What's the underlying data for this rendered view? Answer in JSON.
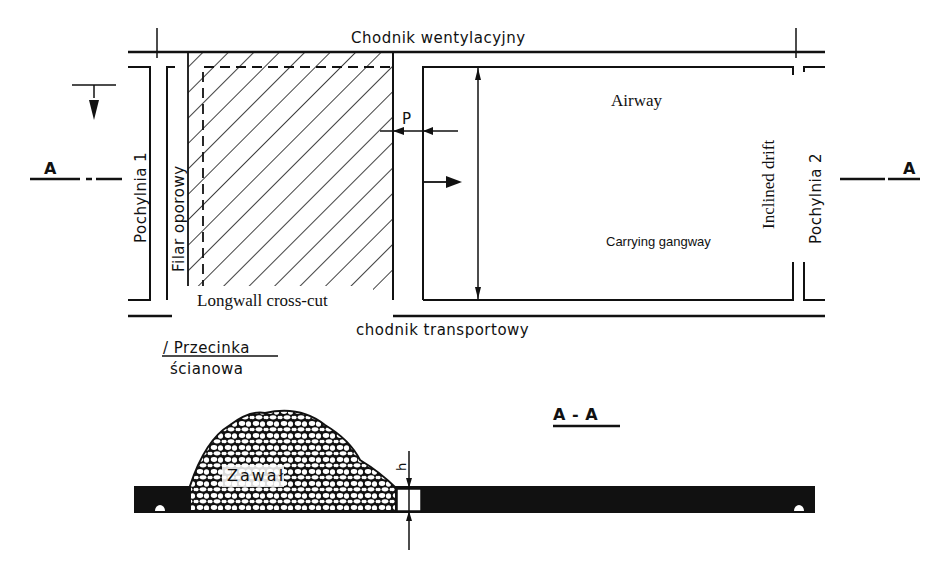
{
  "plan_view": {
    "top_roadway": "Chodnik wentylacyjny",
    "bottom_roadway": "chodnik transportowy",
    "left_drift": "Pochylnia 1",
    "right_drift": "Pochylnia 2",
    "support_pillar": "Filar oporowy",
    "cross_cut_pl_line1": "/ Przecinka",
    "cross_cut_pl_line2": "ścianowa",
    "section_marker_left": "A",
    "section_marker_right": "A",
    "dimension_p": "P",
    "dimension_l": "L"
  },
  "overlay_labels": {
    "airway": "Airway",
    "carrying_gangway": "Carrying gangway",
    "inclined_drift": "Inclined drift",
    "longwall_cross_cut": "Longwall cross-cut"
  },
  "section_view": {
    "title": "A - A",
    "cave_in_label": "Zawał",
    "dimension_h": "h"
  },
  "colors": {
    "ink": "#111111",
    "paper": "#ffffff"
  }
}
